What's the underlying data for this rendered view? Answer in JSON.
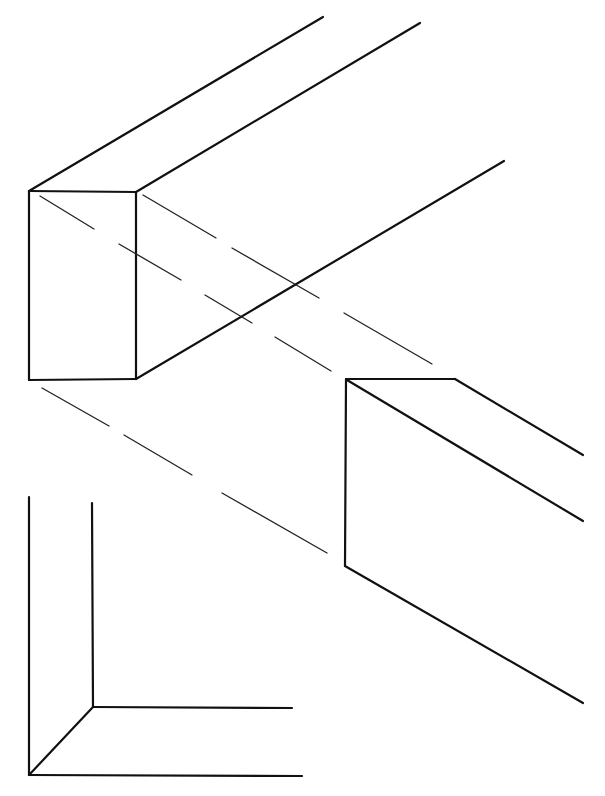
{
  "diagram": {
    "background": "#ffffff",
    "stroke_color": "#111111",
    "upper_beam": {
      "label": "",
      "solid_lines": [
        [
          29,
          191,
          136,
          192
        ],
        [
          136,
          192,
          136,
          379
        ],
        [
          136,
          379,
          29,
          380
        ],
        [
          29,
          380,
          29,
          191
        ],
        [
          29,
          191,
          323,
          17
        ],
        [
          136,
          192,
          420,
          23
        ],
        [
          136,
          379,
          504,
          161
        ]
      ]
    },
    "hidden_lines": [
      [
        40,
        196,
        94,
        229
      ],
      [
        119,
        244,
        181,
        280
      ],
      [
        205,
        295,
        252,
        323
      ],
      [
        275,
        337,
        331,
        371
      ],
      [
        143,
        195,
        216,
        238
      ],
      [
        232,
        248,
        319,
        298
      ],
      [
        344,
        313,
        432,
        364
      ],
      [
        42,
        388,
        109,
        426
      ],
      [
        124,
        435,
        192,
        475
      ],
      [
        222,
        493,
        327,
        553
      ]
    ],
    "lower_beam": {
      "label": "",
      "solid_lines": [
        [
          346,
          379,
          455,
          379
        ],
        [
          455,
          379,
          583,
          455
        ],
        [
          347,
          380,
          583,
          521
        ],
        [
          346,
          379,
          345,
          566
        ],
        [
          345,
          566,
          583,
          703
        ]
      ]
    },
    "corner_axes": {
      "label": "",
      "solid_lines": [
        [
          29,
          497,
          29,
          775
        ],
        [
          92,
          503,
          93,
          707
        ],
        [
          93,
          707,
          292,
          708
        ],
        [
          29,
          775,
          302,
          776
        ],
        [
          93,
          707,
          29,
          775
        ]
      ]
    }
  }
}
